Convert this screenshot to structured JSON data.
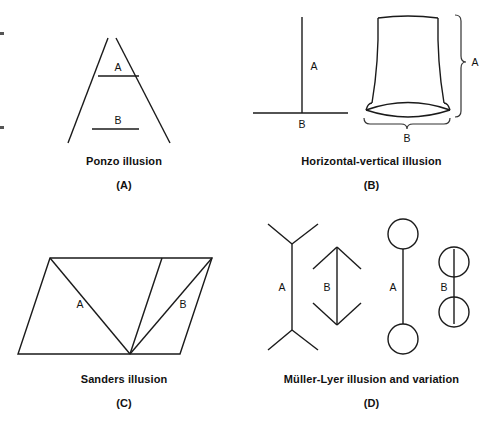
{
  "figure": {
    "title_visible": false,
    "background_color": "#ffffff",
    "ink_color": "#1a1a1a",
    "width": 495,
    "height": 424
  },
  "panels": [
    {
      "id": "A",
      "letter": "(A)",
      "caption": "Ponzo illusion",
      "labels": {
        "upper": "A",
        "lower": "B"
      },
      "description": "Two converging oblique lines with two horizontal segments between them"
    },
    {
      "id": "B",
      "letter": "(B)",
      "caption": "Horizontal-vertical illusion",
      "labels": {
        "vertical": "A",
        "horizontal": "B",
        "table_height": "A",
        "table_width": "B"
      },
      "description": "Inverted-T figure and a table/hourglass shape with braces"
    },
    {
      "id": "C",
      "letter": "(C)",
      "caption": "Sanders illusion",
      "labels": {
        "left_diagonal": "A",
        "right_diagonal": "B"
      },
      "description": "Parallelogram divided by diagonals into two compared segments"
    },
    {
      "id": "D",
      "letter": "(D)",
      "caption": "Müller-Lyer illusion and variation",
      "labels": {
        "fins_out": "A",
        "fins_in": "B",
        "circles_out": "A",
        "circles_on": "B"
      },
      "description": "Classic arrow-fin figures plus a circle-terminated variation"
    }
  ],
  "edge_marks": {
    "count": 2,
    "color": "#555555"
  }
}
